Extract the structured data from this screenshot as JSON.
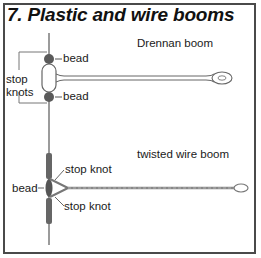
{
  "title": "7. Plastic and wire booms",
  "drennan": {
    "name": "Drennan boom",
    "labels": {
      "bead_top": "bead",
      "bead_bottom": "bead",
      "stop_knots": "stop\nknots"
    }
  },
  "twisted": {
    "name": "twisted wire boom",
    "labels": {
      "stop_knot_top": "stop knot",
      "bead": "bead",
      "stop_knot_bottom": "stop knot"
    }
  },
  "colors": {
    "border": "#4a4a4a",
    "line": "#7a7a7a",
    "bead": "#5a5a5a",
    "text": "#1a1a1a"
  }
}
